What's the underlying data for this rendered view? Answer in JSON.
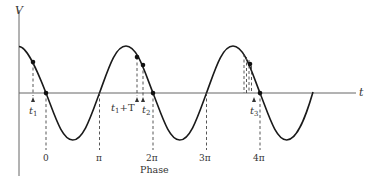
{
  "diagram": {
    "axes": {
      "y_label": "V",
      "x_label": "t"
    },
    "time_markers": [
      {
        "label": "t",
        "sub": "1",
        "extra": ""
      },
      {
        "label": "t",
        "sub": "1",
        "extra": "+T"
      },
      {
        "label": "t",
        "sub": "2",
        "extra": ""
      },
      {
        "label": "t",
        "sub": "3",
        "extra": ""
      }
    ],
    "phase_ticks": [
      "0",
      "π",
      "2π",
      "3π",
      "4π"
    ],
    "phase_axis_label": "Phase",
    "colors": {
      "curve": "#1a1a1a",
      "axis": "#555555",
      "dash": "#444444",
      "background": "#ffffff"
    }
  }
}
